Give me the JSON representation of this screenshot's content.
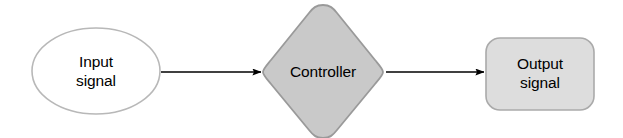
{
  "diagram": {
    "type": "block-diagram",
    "background_color": "#ffffff",
    "nodes": [
      {
        "id": "input",
        "shape": "ellipse",
        "label": "Input\nsignal",
        "label_lines": [
          "Input",
          "signal"
        ],
        "fill_color": "#ffffff",
        "stroke_color": "#b4b4b4",
        "text_color": "#000000"
      },
      {
        "id": "controller",
        "shape": "diamond",
        "label": "Controller",
        "label_lines": [
          "Controller"
        ],
        "fill_color": "#c9c9c9",
        "stroke_color": "#9a9a9a",
        "text_color": "#000000"
      },
      {
        "id": "output",
        "shape": "rounded-rectangle",
        "label": "Output\nsignal",
        "label_lines": [
          "Output",
          "signal"
        ],
        "fill_color": "#dddddd",
        "stroke_color": "#aaaaaa",
        "text_color": "#000000"
      }
    ],
    "edges": [
      {
        "id": "input-to-controller",
        "from": "input",
        "to": "controller",
        "label": "",
        "arrowhead": "solid-triangle",
        "stroke_color": "#000000"
      },
      {
        "id": "controller-to-output",
        "from": "controller",
        "to": "output",
        "label": "",
        "arrowhead": "solid-triangle",
        "stroke_color": "#000000"
      }
    ]
  }
}
